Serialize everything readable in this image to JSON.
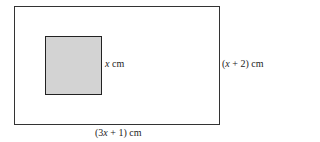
{
  "diagram": {
    "outer_rectangle": {
      "width_label": "(3x + 1) cm",
      "height_label": "(x + 2) cm"
    },
    "inner_square": {
      "side_label": "x cm",
      "fill": "#d3d3d3"
    }
  }
}
